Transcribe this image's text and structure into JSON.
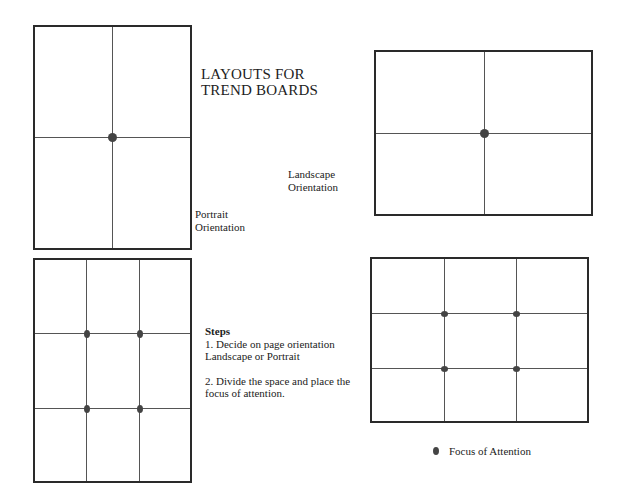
{
  "title": {
    "line1": "LAYOUTS FOR",
    "line2": "TREND BOARDS"
  },
  "labels": {
    "portrait": {
      "line1": "Portrait",
      "line2": "Orientation"
    },
    "landscape": {
      "line1": "Landscape",
      "line2": "Orientation"
    }
  },
  "steps": {
    "heading": "Steps",
    "step1_line1": "1. Decide on page orientation",
    "step1_line2": "Landscape or Portrait",
    "step2_line1": "2. Divide the space and place the",
    "step2_line2": "focus of attention."
  },
  "legend": {
    "icon": "focus-dot",
    "label": "Focus of Attention"
  },
  "boards": [
    {
      "name": "portrait-halves",
      "orientation": "portrait",
      "grid": "2x2",
      "focus_points": 1
    },
    {
      "name": "landscape-halves",
      "orientation": "landscape",
      "grid": "2x2",
      "focus_points": 1
    },
    {
      "name": "portrait-thirds",
      "orientation": "portrait",
      "grid": "3x3",
      "focus_points": 4
    },
    {
      "name": "landscape-thirds",
      "orientation": "landscape",
      "grid": "3x3",
      "focus_points": 4
    }
  ],
  "colors": {
    "border": "#2a2a2a",
    "gridline": "#555555",
    "focus_dot": "#444444",
    "text": "#222222"
  }
}
